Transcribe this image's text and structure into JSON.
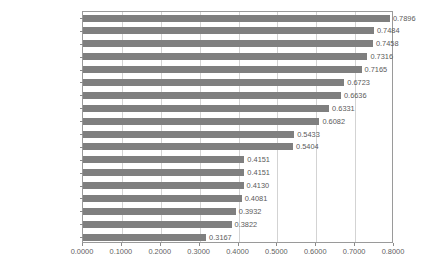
{
  "chart_data": {
    "type": "bar",
    "orientation": "horizontal",
    "title": "",
    "xlabel": "",
    "ylabel": "",
    "xlim": [
      0.0,
      0.8
    ],
    "xticks": [
      "0.0000",
      "0.1000",
      "0.2000",
      "0.3000",
      "0.4000",
      "0.5000",
      "0.6000",
      "0.7000",
      "0.8000"
    ],
    "xtick_values": [
      0.0,
      0.1,
      0.2,
      0.3,
      0.4,
      0.5,
      0.6,
      0.7,
      0.8
    ],
    "grid": "vertical",
    "legend": "none",
    "bar_color": "#7f7f7f",
    "categories": [
      "Drainage",
      "Security",
      "Telecommunication",
      "Seepage",
      "Spalling",
      "Electricity",
      "Fire",
      "Lift",
      "Maintenance",
      "Cleaning",
      "Staircase",
      "Foyer",
      "External",
      "Age",
      "Clubhouse",
      "Carpark",
      "MarketFoyer",
      "Playground"
    ],
    "values": [
      0.7896,
      0.7484,
      0.7458,
      0.7316,
      0.7165,
      0.6723,
      0.6636,
      0.6331,
      0.6082,
      0.5433,
      0.5404,
      0.4151,
      0.4151,
      0.413,
      0.4081,
      0.3932,
      0.3822,
      0.3167
    ],
    "value_labels": [
      "0.7896",
      "0.7484",
      "0.7458",
      "0.7316",
      "0.7165",
      "0.6723",
      "0.6636",
      "0.6331",
      "0.6082",
      "0.5433",
      "0.5404",
      "0.4151",
      "0.4151",
      "0.4130",
      "0.4081",
      "0.3932",
      "0.3822",
      "0.3167"
    ]
  }
}
